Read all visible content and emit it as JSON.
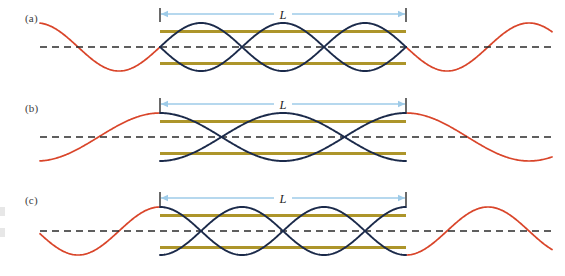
{
  "figure": {
    "width": 565,
    "height": 276,
    "background": "#ffffff"
  },
  "colors": {
    "pipe_edge": "#a9901f",
    "pipe_mid": "#f2e3a8",
    "pipe_body": "#e0c659",
    "wave_inside": "#1b2a4a",
    "wave_outside": "#d9452a",
    "axis_dash": "#2b2b2b",
    "dimension_arrow": "#9ecbe8",
    "dimension_tick": "#2b2b2b",
    "label_text": "#3a3a3a"
  },
  "geometry": {
    "pipe_left": 160,
    "pipe_right": 406,
    "pipe_height": 39,
    "wave_left_extent": 40,
    "wave_right_extent": 552
  },
  "panels": [
    {
      "id": "a",
      "label": "(a)",
      "dimension_label": "L",
      "harmonic": 1,
      "half_wavelengths": 3,
      "pipe_top": 28,
      "pipe_bottom": 67,
      "axis_y": 47,
      "amplitude": 24,
      "arrow_y": 14,
      "tick_top": 8,
      "tick_bottom": 22,
      "inside_phase": "node-center",
      "interior_nodes": 1,
      "description": "Fundamental: one half-wavelength fits between the open ends; antinodes at both ends, single node at the center."
    },
    {
      "id": "b",
      "label": "(b)",
      "dimension_label": "L",
      "harmonic": 2,
      "half_wavelengths": 2,
      "pipe_top": 28,
      "pipe_bottom": 67,
      "axis_y": 47,
      "amplitude": 24,
      "arrow_y": 14,
      "tick_top": 8,
      "tick_bottom": 22,
      "inside_phase": "antinode-ends",
      "interior_nodes": 2,
      "description": "Second harmonic: two half-wavelengths fit in the pipe, giving two interior nodes."
    },
    {
      "id": "c",
      "label": "(c)",
      "dimension_label": "L",
      "harmonic": 3,
      "half_wavelengths": 3,
      "pipe_top": 30,
      "pipe_bottom": 69,
      "axis_y": 49,
      "amplitude": 24,
      "arrow_y": 16,
      "tick_top": 10,
      "tick_bottom": 24,
      "inside_phase": "antinode-ends",
      "interior_nodes": 3,
      "description": "Third harmonic: three half-wavelengths fit in the pipe, giving three interior nodes."
    }
  ]
}
